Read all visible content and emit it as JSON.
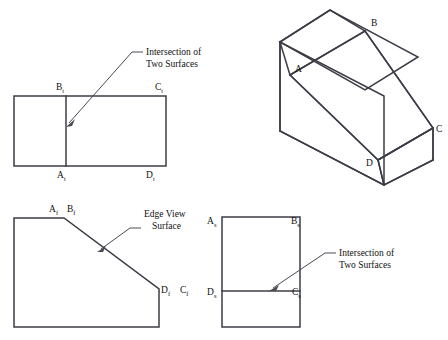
{
  "figure": {
    "type": "orthographic-projection-technical-drawing",
    "line_color": "#3c3c46",
    "leader_color": "#4a4a54",
    "background": "#ffffff"
  },
  "top_view": {
    "name": "top-view",
    "labels": {
      "b": "B",
      "b_sub": "t",
      "c": "C",
      "c_sub": "t",
      "a": "A",
      "a_sub": "t",
      "d": "D",
      "d_sub": "t"
    }
  },
  "front_view": {
    "name": "front-view",
    "labels": {
      "a": "A",
      "a_sub": "f",
      "b": "B",
      "b_sub": "f",
      "d": "D",
      "d_sub": "f",
      "c": "C",
      "c_sub": "f"
    }
  },
  "side_view": {
    "name": "side-view",
    "labels": {
      "a": "A",
      "a_sub": "s",
      "b": "B",
      "b_sub": "s",
      "d": "D",
      "d_sub": "s",
      "c": "C",
      "c_sub": "s"
    }
  },
  "pictorial_view": {
    "name": "isometric-pictorial-view",
    "labels": {
      "a": "A",
      "b": "B",
      "c": "C",
      "d": "D"
    }
  },
  "annotations": {
    "top_note_line1": "Intersection of",
    "top_note_line2": "Two Surfaces",
    "front_note_line1": "Edge View",
    "front_note_line2": "Surface",
    "side_note_line1": "Intersection of",
    "side_note_line2": "Two Surfaces"
  }
}
